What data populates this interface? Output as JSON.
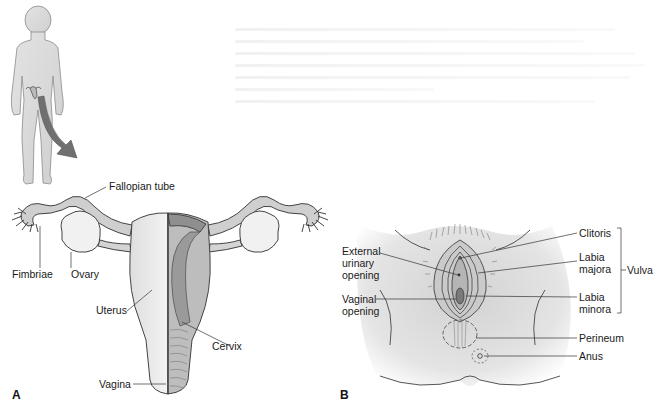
{
  "figure": {
    "panel_a": {
      "letter": "A",
      "labels": {
        "fallopian_tube": "Fallopian tube",
        "fimbriae": "Fimbriae",
        "ovary": "Ovary",
        "uterus": "Uterus",
        "cervix": "Cervix",
        "vagina": "Vagina"
      }
    },
    "panel_b": {
      "letter": "B",
      "labels": {
        "external_urinary_opening": [
          "External",
          "urinary",
          "opening"
        ],
        "vaginal_opening": [
          "Vaginal",
          "opening"
        ],
        "clitoris": "Clitoris",
        "labia_majora": [
          "Labia",
          "majora"
        ],
        "labia_minora": [
          "Labia",
          "minora"
        ],
        "vulva": "Vulva",
        "perineum": "Perineum",
        "anus": "Anus"
      }
    },
    "colors": {
      "body_fill": "#d9d9d9",
      "tissue_fill": "#c9c9c9",
      "muscle_fill": "#9d9d9d",
      "outline": "#444444",
      "arrow": "#6e6e6e",
      "text": "#1a1a1a"
    }
  }
}
